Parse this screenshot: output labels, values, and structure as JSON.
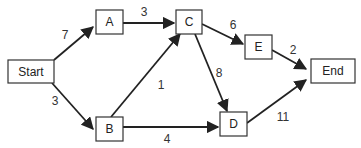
{
  "diagram": {
    "type": "network",
    "nodes": [
      {
        "id": "start",
        "label": "Start"
      },
      {
        "id": "a",
        "label": "A"
      },
      {
        "id": "b",
        "label": "B"
      },
      {
        "id": "c",
        "label": "C"
      },
      {
        "id": "d",
        "label": "D"
      },
      {
        "id": "e",
        "label": "E"
      },
      {
        "id": "end",
        "label": "End"
      }
    ],
    "edges": [
      {
        "from": "Start",
        "to": "A",
        "weight": "7"
      },
      {
        "from": "Start",
        "to": "B",
        "weight": "3"
      },
      {
        "from": "A",
        "to": "C",
        "weight": "3"
      },
      {
        "from": "B",
        "to": "C",
        "weight": "1"
      },
      {
        "from": "B",
        "to": "D",
        "weight": "4"
      },
      {
        "from": "C",
        "to": "E",
        "weight": "6"
      },
      {
        "from": "C",
        "to": "D",
        "weight": "8"
      },
      {
        "from": "E",
        "to": "End",
        "weight": "2"
      },
      {
        "from": "D",
        "to": "End",
        "weight": "11"
      }
    ]
  }
}
